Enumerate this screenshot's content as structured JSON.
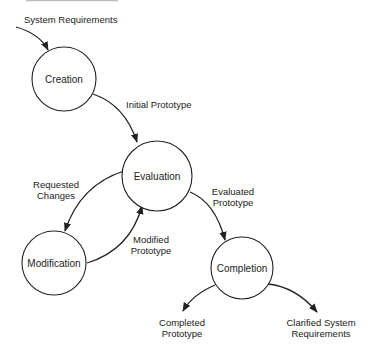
{
  "diagram": {
    "type": "state-transition",
    "nodes": [
      {
        "id": "creation",
        "label": "Creation",
        "cx": 64,
        "cy": 79,
        "r": 32
      },
      {
        "id": "evaluation",
        "label": "Evaluation",
        "cx": 157,
        "cy": 176,
        "r": 35
      },
      {
        "id": "modification",
        "label": "Modification",
        "cx": 54,
        "cy": 263,
        "r": 32
      },
      {
        "id": "completion",
        "label": "Completion",
        "cx": 242,
        "cy": 268,
        "r": 31
      }
    ],
    "edges": [
      {
        "id": "system-requirements",
        "from": null,
        "to": "creation",
        "label": "System Requirements"
      },
      {
        "id": "initial-prototype",
        "from": "creation",
        "to": "evaluation",
        "label": "Initial Prototype"
      },
      {
        "id": "requested-changes",
        "from": "evaluation",
        "to": "modification",
        "label_lines": [
          "Requested",
          "Changes"
        ]
      },
      {
        "id": "modified-prototype",
        "from": "modification",
        "to": "evaluation",
        "label_lines": [
          "Modified",
          "Prototype"
        ]
      },
      {
        "id": "evaluated-prototype",
        "from": "evaluation",
        "to": "completion",
        "label_lines": [
          "Evaluated",
          "Prototype"
        ]
      },
      {
        "id": "completed-prototype",
        "from": "completion",
        "to": null,
        "label_lines": [
          "Completed",
          "Prototype"
        ]
      },
      {
        "id": "clarified-system-requirements",
        "from": "completion",
        "to": null,
        "label_lines": [
          "Clarified System",
          "Requirements"
        ]
      }
    ]
  }
}
